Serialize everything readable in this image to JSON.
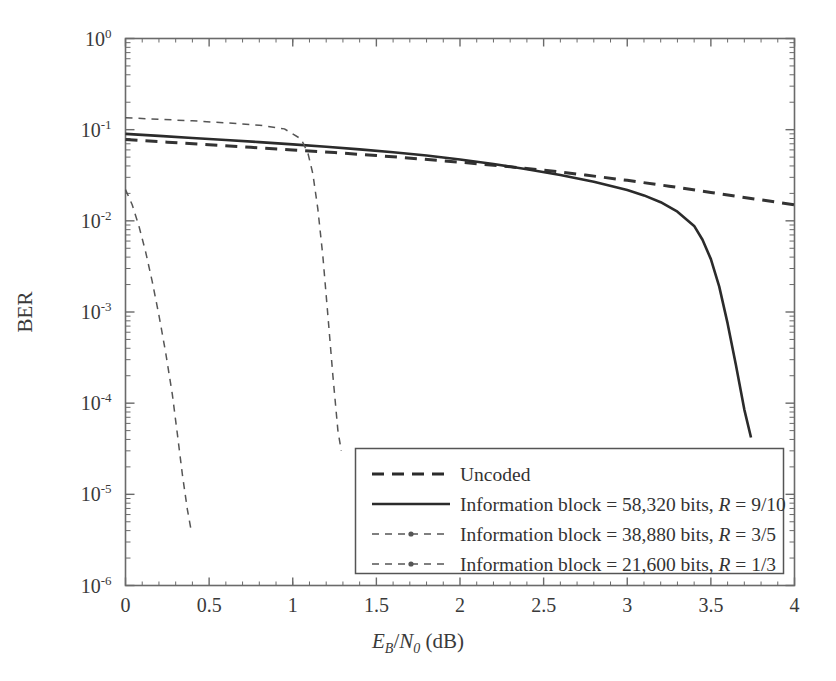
{
  "chart_data": {
    "type": "line",
    "title": "",
    "xlabel": "E_B/N_0 (dB)",
    "ylabel": "BER",
    "xlabel_parts": {
      "e": "E",
      "e_sub": "B",
      "slash": "/",
      "n": "N",
      "n_sub": "0",
      "unit": "(dB)"
    },
    "xlim": [
      0,
      4
    ],
    "ylim": [
      1e-06,
      1
    ],
    "yscale": "log",
    "xscale": "linear",
    "grid": false,
    "xticks": [
      0,
      0.5,
      1,
      1.5,
      2,
      2.5,
      3,
      3.5,
      4
    ],
    "xtick_labels": [
      "0",
      "0.5",
      "1",
      "1.5",
      "2",
      "2.5",
      "3",
      "3.5",
      "4"
    ],
    "yticks": [
      1,
      0.1,
      0.01,
      0.001,
      0.0001,
      1e-05,
      1e-06
    ],
    "ytick_labels": [
      "10^0",
      "10^-1",
      "10^-2",
      "10^-3",
      "10^-4",
      "10^-5",
      "10^-6"
    ],
    "ytick_exponents": [
      "0",
      "-1",
      "-2",
      "-3",
      "-4",
      "-5",
      "-6"
    ],
    "ytick_mantissa": "10",
    "legend_position": "lower right",
    "series": [
      {
        "name": "Uncoded",
        "label": "Uncoded",
        "style": "dashed-thick",
        "color": "#333333",
        "x": [
          0.0,
          0.25,
          0.5,
          0.75,
          1.0,
          1.25,
          1.5,
          1.75,
          2.0,
          2.25,
          2.5,
          2.75,
          3.0,
          3.25,
          3.5,
          3.75,
          4.0
        ],
        "y": [
          0.078,
          0.073,
          0.0685,
          0.064,
          0.06,
          0.056,
          0.052,
          0.048,
          0.044,
          0.04,
          0.036,
          0.0318,
          0.0278,
          0.024,
          0.0205,
          0.0175,
          0.015
        ]
      },
      {
        "name": "Information block = 58,320 bits, R = 9/10",
        "label_prefix": "Information block = 58,320 bits, ",
        "label_italic": "R",
        "label_suffix": " = 9/10",
        "info_block_bits": "58,320",
        "rate": "9/10",
        "style": "solid",
        "color": "#2b2b2b",
        "x": [
          0.0,
          0.2,
          0.4,
          0.6,
          0.8,
          1.0,
          1.2,
          1.4,
          1.6,
          1.8,
          2.0,
          2.2,
          2.4,
          2.6,
          2.8,
          3.0,
          3.1,
          3.2,
          3.3,
          3.4,
          3.45,
          3.5,
          3.55,
          3.6,
          3.65,
          3.7,
          3.74
        ],
        "y": [
          0.09,
          0.0855,
          0.081,
          0.077,
          0.073,
          0.069,
          0.065,
          0.0608,
          0.0565,
          0.052,
          0.047,
          0.042,
          0.0368,
          0.0318,
          0.0268,
          0.0218,
          0.019,
          0.016,
          0.0126,
          0.0088,
          0.0062,
          0.0038,
          0.0019,
          0.00075,
          0.00026,
          8.5e-05,
          4.2e-05
        ]
      },
      {
        "name": "Information block = 38,880 bits, R = 3/5",
        "label_prefix": "Information block = 38,880 bits, ",
        "label_italic": "R",
        "label_suffix": " = 3/5",
        "info_block_bits": "38,880",
        "rate": "3/5",
        "style": "dashed-thin",
        "color": "#555555",
        "x": [
          0.0,
          0.2,
          0.4,
          0.6,
          0.8,
          0.95,
          1.05,
          1.09,
          1.12,
          1.15,
          1.18,
          1.21,
          1.24,
          1.27,
          1.29
        ],
        "y": [
          0.135,
          0.13,
          0.125,
          0.119,
          0.112,
          0.102,
          0.079,
          0.056,
          0.033,
          0.0135,
          0.0041,
          0.00092,
          0.0002,
          5e-05,
          3e-05
        ]
      },
      {
        "name": "Information block = 21,600 bits, R = 1/3",
        "label_prefix": "Information block = 21,600 bits, ",
        "label_italic": "R",
        "label_suffix": " = 1/3",
        "info_block_bits": "21,600",
        "rate": "1/3",
        "style": "dashed-thin",
        "color": "#555555",
        "x": [
          0.0,
          0.04,
          0.08,
          0.12,
          0.16,
          0.2,
          0.24,
          0.28,
          0.31,
          0.34,
          0.37,
          0.395
        ],
        "y": [
          0.022,
          0.015,
          0.0088,
          0.0046,
          0.00215,
          0.00092,
          0.00036,
          0.000125,
          4.6e-05,
          1.65e-05,
          6.8e-06,
          3.8e-06
        ]
      }
    ]
  },
  "legend": {
    "entries": [
      {
        "label": "Uncoded",
        "prefix": "Uncoded",
        "italic": "",
        "suffix": "",
        "style": "dashed-thick"
      },
      {
        "label": "Information block = 58,320 bits, R = 9/10",
        "prefix": "Information block = 58,320 bits, ",
        "italic": "R",
        "suffix": " = 9/10",
        "style": "solid"
      },
      {
        "label": "Information block = 38,880 bits, R = 3/5",
        "prefix": "Information block = 38,880 bits, ",
        "italic": "R",
        "suffix": " = 3/5",
        "style": "dashed-dot-thin"
      },
      {
        "label": "Information block = 21,600 bits, R = 1/3",
        "prefix": "Information block = 21,600 bits, ",
        "italic": "R",
        "suffix": " = 1/3",
        "style": "dashed-dot-thin"
      }
    ]
  },
  "colors": {
    "axis": "#6a6a6a",
    "text": "#3a3a3a",
    "solid_curve": "#2b2b2b",
    "dashed_curve": "#555555",
    "legend_border": "#555555",
    "background": "#ffffff"
  }
}
